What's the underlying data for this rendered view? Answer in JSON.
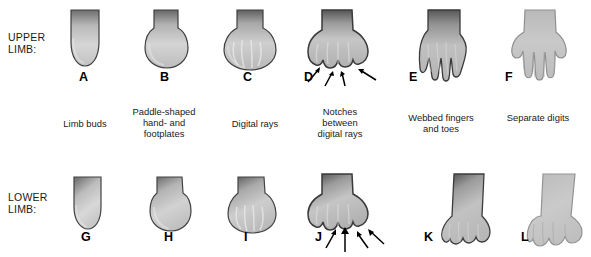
{
  "figure": {
    "title_upper": "UPPER\nLIMB:",
    "title_lower": "LOWER\nLIMB:"
  },
  "row_labels": {
    "upper": "UPPER\nLIMB:",
    "lower": "LOWER\nLIMB:"
  },
  "upper_limb": [
    {
      "letter": "A",
      "stage": "limb-bud"
    },
    {
      "letter": "B",
      "stage": "paddle-plate"
    },
    {
      "letter": "C",
      "stage": "digital-rays"
    },
    {
      "letter": "D",
      "stage": "notches"
    },
    {
      "letter": "E",
      "stage": "webbed-digits"
    },
    {
      "letter": "F",
      "stage": "separate-digits"
    }
  ],
  "lower_limb": [
    {
      "letter": "G",
      "stage": "limb-bud"
    },
    {
      "letter": "H",
      "stage": "paddle-plate"
    },
    {
      "letter": "I",
      "stage": "digital-rays"
    },
    {
      "letter": "J",
      "stage": "notches"
    },
    {
      "letter": "K",
      "stage": "webbed-digits"
    },
    {
      "letter": "L",
      "stage": "separate-digits"
    }
  ],
  "captions": [
    "Limb buds",
    "Paddle-shaped\nhand- and\nfootplates",
    "Digital rays",
    "Notches\nbetween\ndigital rays",
    "Webbed fingers\nand toes",
    "Separate digits"
  ],
  "colors": {
    "outline": "#3b3b3b",
    "fill_light": "#d8d8d8",
    "fill_mid": "#b5b5b5",
    "fill_dark": "#5a5a5a",
    "background": "#ffffff",
    "text": "#1a1a1a"
  }
}
